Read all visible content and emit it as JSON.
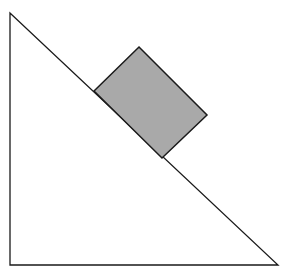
{
  "diagram": {
    "canvas": {
      "width": 290,
      "height": 268,
      "background": "#ffffff"
    },
    "incline": {
      "points": [
        [
          10,
          13
        ],
        [
          10,
          265
        ],
        [
          278,
          265
        ]
      ],
      "stroke": "#1a1a1a",
      "fill": "#ffffff"
    },
    "block": {
      "points": [
        [
          94,
          91
        ],
        [
          139,
          47
        ],
        [
          207,
          115
        ],
        [
          162,
          158
        ]
      ],
      "stroke": "#1a1a1a",
      "fill": "#a9a9a9"
    }
  }
}
